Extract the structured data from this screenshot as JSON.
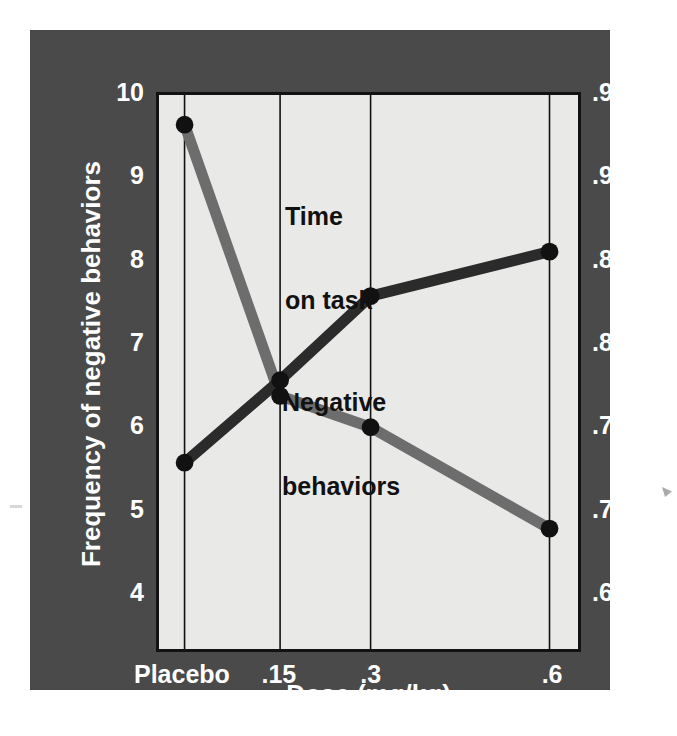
{
  "chart_data": {
    "type": "line",
    "title": "",
    "xlabel": "Dose (mg/kg)",
    "ylabel": "Frequency of negative behaviors",
    "y2label": "Proportion on task",
    "categories": [
      "Placebo",
      ".15",
      ".3",
      ".6"
    ],
    "category_positions": [
      0.061,
      0.289,
      0.505,
      0.932
    ],
    "ylim": [
      4,
      10
    ],
    "y2lim": [
      0.65,
      0.95
    ],
    "yticks": [
      "10",
      "9",
      "8",
      "7",
      "6",
      "5",
      "4"
    ],
    "ytick_values": [
      10,
      9,
      8,
      7,
      6,
      5,
      4
    ],
    "y2ticks": [
      ".95",
      ".90",
      ".85",
      ".80",
      ".75",
      ".70",
      ".65"
    ],
    "y2tick_values": [
      0.95,
      0.9,
      0.85,
      0.8,
      0.75,
      0.7,
      0.65
    ],
    "grid": "vertical-only",
    "legend": "inline-labels",
    "series": [
      {
        "name": "Negative behaviors",
        "label": "Negative\nbehaviors",
        "axis": "left",
        "color": "#6d6d6d",
        "marker_color": "#111111",
        "values": [
          9.64,
          6.35,
          5.97,
          4.74
        ]
      },
      {
        "name": "Time on task",
        "label": "Time\non task",
        "axis": "right",
        "color": "#2b2b2b",
        "marker_color": "#111111",
        "values": [
          0.727,
          0.777,
          0.828,
          0.855
        ]
      }
    ]
  },
  "figure": {
    "panel_color": "#4a4a4a",
    "plot_bg_color": "#e9e9e7",
    "axis_color": "#121212",
    "tick_text_color": "#ffffff"
  },
  "axes": {
    "left": {
      "title": "Frequency of negative behaviors",
      "ticks": [
        "10",
        "9",
        "8",
        "7",
        "6",
        "5",
        "4"
      ]
    },
    "right": {
      "title": "Proportion on task",
      "ticks": [
        ".95",
        ".90",
        ".85",
        ".80",
        ".75",
        ".70",
        ".65"
      ]
    },
    "bottom": {
      "title": "Dose (mg/kg)",
      "ticks": [
        "Placebo",
        ".15",
        ".3",
        ".6"
      ]
    }
  },
  "annotations": {
    "time_on_task_line1": "Time",
    "time_on_task_line2": "on task",
    "negative_behaviors_line1": "Negative",
    "negative_behaviors_line2": "behaviors"
  }
}
